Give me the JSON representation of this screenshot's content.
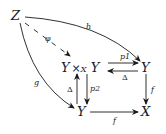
{
  "diagram": {
    "nodes": {
      "z": "Z",
      "pullback_left": "Y",
      "pullback_times": "×",
      "pullback_sub": "X",
      "pullback_right": "Y",
      "y_top_right": "Y",
      "y_bottom": "Y",
      "x": "X"
    },
    "arrows": {
      "h": "h",
      "phi": "φ",
      "g": "g",
      "p1": "p1",
      "p2": "p2",
      "delta_horizontal": "Δ",
      "delta_vertical": "Δ",
      "f_right": "f",
      "f_bottom": "f"
    },
    "colors": {
      "ink": "#1a1a1a"
    }
  }
}
